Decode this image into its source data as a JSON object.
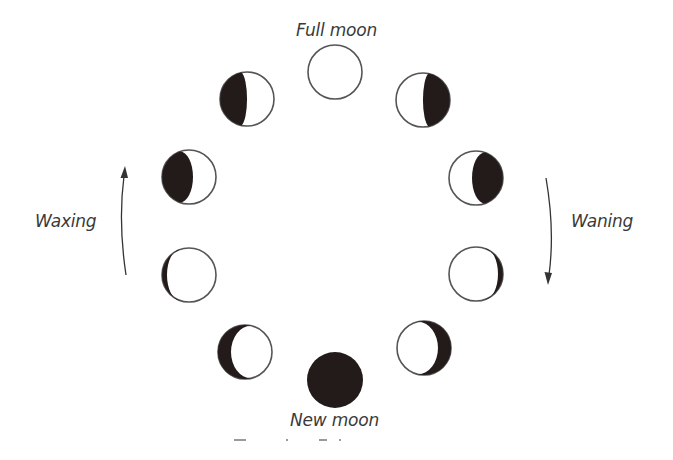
{
  "diagram": {
    "labels": {
      "full_moon": "Full moon",
      "new_moon": "New moon",
      "waxing": "Waxing",
      "waning": "Waning"
    },
    "caption_visible": "",
    "colors": {
      "background": "#ffffff",
      "outline": "#555555",
      "shadow": "#231a1a",
      "text": "#3a3a3a"
    },
    "phases": [
      {
        "id": "full-moon",
        "name": "Full moon",
        "cx": 335,
        "cy": 72,
        "r": 27,
        "dark_side": "none",
        "dark_fraction": 0.0
      },
      {
        "id": "waxing-gibbous-1",
        "name": "Waxing gibbous (late)",
        "cx": 247,
        "cy": 99,
        "r": 27,
        "dark_side": "left",
        "dark_fraction": 0.08
      },
      {
        "id": "waxing-gibbous-2",
        "name": "Waxing gibbous (early)",
        "cx": 189,
        "cy": 177,
        "r": 27,
        "dark_side": "left",
        "dark_fraction": 0.3
      },
      {
        "id": "waxing-crescent-1",
        "name": "Waxing crescent (late)",
        "cx": 189,
        "cy": 275,
        "r": 27,
        "dark_side": "left",
        "dark_fraction": 0.6
      },
      {
        "id": "waxing-crescent-2",
        "name": "Waxing crescent (early)",
        "cx": 245,
        "cy": 352,
        "r": 27,
        "dark_side": "left",
        "dark_fraction": 0.85
      },
      {
        "id": "new-moon",
        "name": "New moon",
        "cx": 335,
        "cy": 380,
        "r": 28,
        "dark_side": "full",
        "dark_fraction": 1.0
      },
      {
        "id": "waning-crescent-2",
        "name": "Waning crescent (late)",
        "cx": 424,
        "cy": 348,
        "r": 27,
        "dark_side": "right",
        "dark_fraction": 0.85
      },
      {
        "id": "waning-crescent-1",
        "name": "Waning crescent (early)",
        "cx": 476,
        "cy": 274,
        "r": 27,
        "dark_side": "right",
        "dark_fraction": 0.6
      },
      {
        "id": "waning-gibbous-2",
        "name": "Waning gibbous (late)",
        "cx": 476,
        "cy": 178,
        "r": 27,
        "dark_side": "right",
        "dark_fraction": 0.3
      },
      {
        "id": "waning-gibbous-1",
        "name": "Waning gibbous (early)",
        "cx": 423,
        "cy": 100,
        "r": 27,
        "dark_side": "right",
        "dark_fraction": 0.08
      }
    ],
    "arrows": [
      {
        "id": "waxing-arrow",
        "direction": "up",
        "x": 125,
        "y_start": 275,
        "y_end": 168
      },
      {
        "id": "waning-arrow",
        "direction": "down",
        "x": 547,
        "y_start": 178,
        "y_end": 283
      }
    ]
  }
}
